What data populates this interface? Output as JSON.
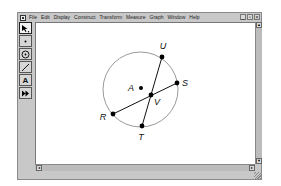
{
  "window": {
    "menu": [
      "File",
      "Edit",
      "Display",
      "Construct",
      "Transform",
      "Measure",
      "Graph",
      "Window",
      "Help"
    ],
    "controls": {
      "minimize": "_",
      "maximize": "▫",
      "close": "×"
    }
  },
  "toolbox": {
    "tools": [
      {
        "name": "selection-arrow-tool",
        "glyph": "↖"
      },
      {
        "name": "point-tool",
        "glyph": "•"
      },
      {
        "name": "compass-tool",
        "glyph": "⊙"
      },
      {
        "name": "straightedge-tool",
        "glyph": "/"
      },
      {
        "name": "text-tool",
        "glyph": "A"
      },
      {
        "name": "custom-tool",
        "glyph": "⏩"
      }
    ]
  },
  "scrollbars": {
    "up": "▲",
    "down": "▼",
    "left": "◂",
    "right": "▸"
  },
  "diagram": {
    "circle": {
      "center": "A",
      "cx": 140.5,
      "cy": 89.5,
      "r": 37.5
    },
    "points": [
      {
        "label": "U",
        "x": 162,
        "y": 57,
        "lx": 163,
        "ly": 49
      },
      {
        "label": "S",
        "x": 177,
        "y": 83,
        "lx": 185,
        "ly": 86
      },
      {
        "label": "A",
        "x": 141,
        "y": 88,
        "lx": 131,
        "ly": 91
      },
      {
        "label": "V",
        "x": 151,
        "y": 95,
        "lx": 157,
        "ly": 105
      },
      {
        "label": "R",
        "x": 113,
        "y": 114,
        "lx": 103,
        "ly": 120
      },
      {
        "label": "T",
        "x": 142,
        "y": 126,
        "lx": 141,
        "ly": 140
      }
    ],
    "segments": [
      {
        "from": "U",
        "to": "T"
      },
      {
        "from": "R",
        "to": "S"
      }
    ],
    "colors": {
      "circle": "#9a9a9a",
      "segment": "#111111",
      "point": "#000000"
    }
  }
}
